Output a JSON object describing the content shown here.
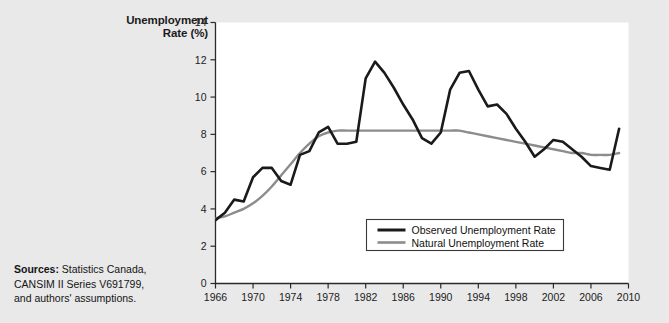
{
  "figure": {
    "background_color": "#e9e9e9",
    "plot_background_color": "#ffffff",
    "y_axis_title_line1": "Unemployment",
    "y_axis_title_line2": "Rate (%)",
    "sources_label": "Sources:",
    "sources_text": "Statistics Canada,",
    "sources_line2": "CANSIM II Series V691799,",
    "sources_line3": "and authors' assumptions."
  },
  "chart_data": {
    "type": "line",
    "title": "",
    "xlabel": "",
    "ylabel": "Unemployment Rate (%)",
    "xlim": [
      1966,
      2010
    ],
    "ylim": [
      0,
      14
    ],
    "xticks": [
      1966,
      1970,
      1974,
      1978,
      1982,
      1986,
      1990,
      1994,
      1998,
      2002,
      2006,
      2010
    ],
    "yticks": [
      0,
      2,
      4,
      6,
      8,
      10,
      12,
      14
    ],
    "grid": false,
    "legend_position": "inside-lower-center",
    "x": [
      1966,
      1967,
      1968,
      1969,
      1970,
      1971,
      1972,
      1973,
      1974,
      1975,
      1976,
      1977,
      1978,
      1979,
      1980,
      1981,
      1982,
      1983,
      1984,
      1985,
      1986,
      1987,
      1988,
      1989,
      1990,
      1991,
      1992,
      1993,
      1994,
      1995,
      1996,
      1997,
      1998,
      1999,
      2000,
      2001,
      2002,
      2003,
      2004,
      2005,
      2006,
      2007,
      2008,
      2009
    ],
    "series": [
      {
        "name": "Observed Unemployment Rate",
        "color": "#1a1a1a",
        "width": 2.6,
        "values": [
          3.4,
          3.8,
          4.5,
          4.4,
          5.7,
          6.2,
          6.2,
          5.5,
          5.3,
          6.9,
          7.1,
          8.1,
          8.4,
          7.5,
          7.5,
          7.6,
          11.0,
          11.9,
          11.3,
          10.5,
          9.6,
          8.8,
          7.8,
          7.5,
          8.1,
          10.4,
          11.3,
          11.4,
          10.4,
          9.5,
          9.6,
          9.1,
          8.3,
          7.6,
          6.8,
          7.2,
          7.7,
          7.6,
          7.2,
          6.8,
          6.3,
          6.2,
          6.1,
          8.3
        ]
      },
      {
        "name": "Natural Unemployment Rate",
        "color": "#8c8c8c",
        "width": 2.4,
        "values": [
          3.5,
          3.6,
          3.8,
          4.0,
          4.3,
          4.7,
          5.2,
          5.8,
          6.4,
          7.0,
          7.5,
          7.9,
          8.1,
          8.2,
          8.2,
          8.2,
          8.2,
          8.2,
          8.2,
          8.2,
          8.2,
          8.2,
          8.2,
          8.2,
          8.2,
          8.2,
          8.2,
          8.1,
          8.0,
          7.9,
          7.8,
          7.7,
          7.6,
          7.5,
          7.4,
          7.3,
          7.2,
          7.1,
          7.0,
          7.0,
          6.9,
          6.9,
          6.9,
          7.0
        ]
      }
    ],
    "legend": [
      {
        "label": "Observed Unemployment Rate",
        "color": "#1a1a1a"
      },
      {
        "label": "Natural Unemployment Rate",
        "color": "#8c8c8c"
      }
    ]
  }
}
